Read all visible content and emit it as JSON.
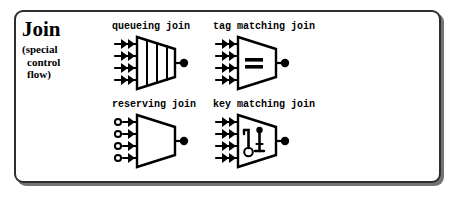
{
  "figure": {
    "title": "Join",
    "subtitle_lines": [
      "(special",
      "control",
      "flow)"
    ],
    "border_color": "#2e2e2e",
    "shadow_color": "#5a5a5a",
    "ink_color": "#000000",
    "background_color": "#ffffff"
  },
  "symbols": [
    {
      "id": "queueing-join",
      "caption": "queueing join",
      "shape": "trapezoid",
      "inner_marks": "three vertical queue bars",
      "input_count": 4,
      "input_style": "double-arrow",
      "output_style": "filled-circle"
    },
    {
      "id": "tag-matching-join",
      "caption": "tag matching join",
      "shape": "trapezoid",
      "inner_marks": "equals sign",
      "input_count": 4,
      "input_style": "double-arrow",
      "output_style": "filled-circle"
    },
    {
      "id": "reserving-join",
      "caption": "reserving join",
      "shape": "trapezoid",
      "inner_marks": "none",
      "input_count": 4,
      "input_style": "open-circle-arrow",
      "output_style": "filled-circle"
    },
    {
      "id": "key-matching-join",
      "caption": "key matching join",
      "shape": "trapezoid",
      "inner_marks": "two keys",
      "input_count": 4,
      "input_style": "double-arrow",
      "output_style": "filled-circle"
    }
  ]
}
